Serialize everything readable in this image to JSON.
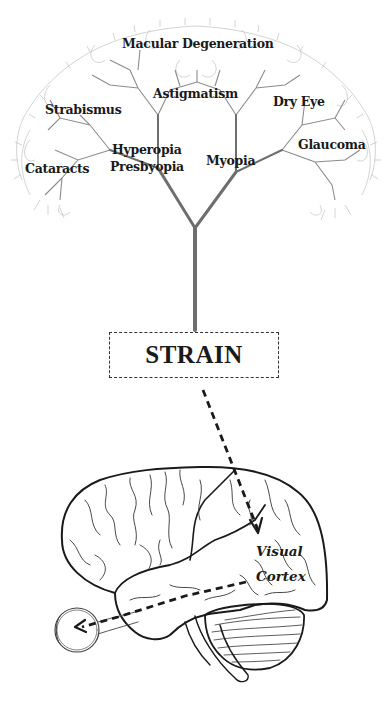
{
  "diagram": {
    "tree": {
      "root_label": "STRAIN",
      "conditions": [
        {
          "label": "Macular Degeneration",
          "x": 122,
          "y": 38
        },
        {
          "label": "Astigmatism",
          "x": 153,
          "y": 88
        },
        {
          "label": "Strabismus",
          "x": 45,
          "y": 104
        },
        {
          "label": "Dry Eye",
          "x": 273,
          "y": 96
        },
        {
          "label": "Hyperopia",
          "x": 112,
          "y": 144
        },
        {
          "label": "Presbyopia",
          "x": 110,
          "y": 161
        },
        {
          "label": "Myopia",
          "x": 206,
          "y": 155
        },
        {
          "label": "Glaucoma",
          "x": 298,
          "y": 139
        },
        {
          "label": "Cataracts",
          "x": 25,
          "y": 163
        }
      ]
    },
    "brain": {
      "region_label_line1": "Visual",
      "region_label_line2": "Cortex"
    },
    "colors": {
      "trunk": "#6e6e6e",
      "branch": "#8a8a8a",
      "twig": "#c4c4c4",
      "ink": "#1a1a1a"
    }
  }
}
